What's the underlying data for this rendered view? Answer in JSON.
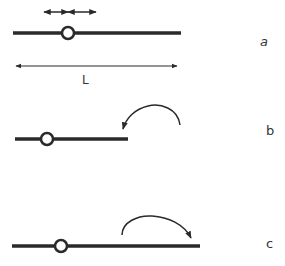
{
  "diagram": {
    "colors": {
      "stroke": "#2a2a2a",
      "background": "#ffffff"
    },
    "panels": [
      {
        "id": "a",
        "label": "a",
        "length_label": "L",
        "annotations": [
          "double-headed slide arrow above pivot",
          "length dimension arrow below rod"
        ]
      },
      {
        "id": "b",
        "label": "b",
        "annotations": [
          "curved counter-clockwise arrow pointing to rod end"
        ]
      },
      {
        "id": "c",
        "label": "c",
        "annotations": [
          "curved clockwise arrow pointing to rod end"
        ]
      }
    ]
  }
}
